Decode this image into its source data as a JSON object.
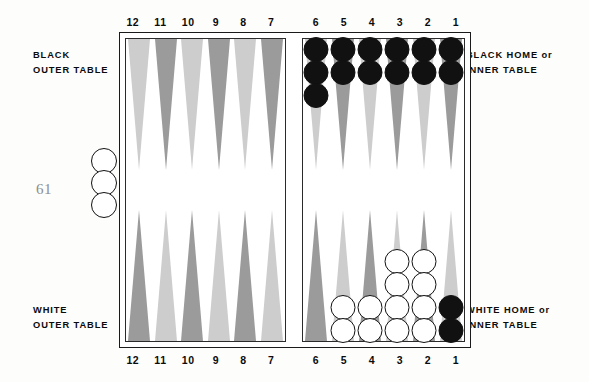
{
  "page": {
    "folio": "61"
  },
  "captions": {
    "black_outer": {
      "line1": "BLACK",
      "line2": "OUTER TABLE"
    },
    "black_home": {
      "line1": "BLACK HOME or",
      "line2": "INNER TABLE"
    },
    "white_outer": {
      "line1": "WHITE",
      "line2": "OUTER TABLE"
    },
    "white_home": {
      "line1": "WHITE HOME or",
      "line2": "INNER TABLE"
    }
  },
  "point_numbers": {
    "outer": [
      "12",
      "11",
      "10",
      "9",
      "8",
      "7"
    ],
    "inner": [
      "6",
      "5",
      "4",
      "3",
      "2",
      "1"
    ]
  },
  "colors": {
    "point_light": "#cdcdcd",
    "point_dark": "#9b9b9b",
    "checker_black": "#111111",
    "checker_white": "#ffffff",
    "board_border": "#1a1a1a",
    "text": "#0b0b0b",
    "folio": "#8d8d8d"
  },
  "board": {
    "quadrants": {
      "black_outer_top": [
        {
          "point": "12",
          "shade": "light",
          "checkers": 0,
          "color": null
        },
        {
          "point": "11",
          "shade": "dark",
          "checkers": 0,
          "color": null
        },
        {
          "point": "10",
          "shade": "light",
          "checkers": 0,
          "color": null
        },
        {
          "point": "9",
          "shade": "dark",
          "checkers": 0,
          "color": null
        },
        {
          "point": "8",
          "shade": "light",
          "checkers": 0,
          "color": null
        },
        {
          "point": "7",
          "shade": "dark",
          "checkers": 0,
          "color": null
        }
      ],
      "black_home_top": [
        {
          "point": "6",
          "shade": "light",
          "checkers": 3,
          "color": "black"
        },
        {
          "point": "5",
          "shade": "dark",
          "checkers": 2,
          "color": "black"
        },
        {
          "point": "4",
          "shade": "light",
          "checkers": 2,
          "color": "black"
        },
        {
          "point": "3",
          "shade": "dark",
          "checkers": 2,
          "color": "black"
        },
        {
          "point": "2",
          "shade": "light",
          "checkers": 2,
          "color": "black"
        },
        {
          "point": "1",
          "shade": "dark",
          "checkers": 2,
          "color": "black"
        }
      ],
      "white_outer_bottom": [
        {
          "point": "12",
          "shade": "dark",
          "checkers": 0,
          "color": null
        },
        {
          "point": "11",
          "shade": "light",
          "checkers": 0,
          "color": null
        },
        {
          "point": "10",
          "shade": "dark",
          "checkers": 0,
          "color": null
        },
        {
          "point": "9",
          "shade": "light",
          "checkers": 0,
          "color": null
        },
        {
          "point": "8",
          "shade": "dark",
          "checkers": 0,
          "color": null
        },
        {
          "point": "7",
          "shade": "light",
          "checkers": 0,
          "color": null
        }
      ],
      "white_home_bottom": [
        {
          "point": "6",
          "shade": "dark",
          "checkers": 0,
          "color": null
        },
        {
          "point": "5",
          "shade": "light",
          "checkers": 2,
          "color": "white"
        },
        {
          "point": "4",
          "shade": "dark",
          "checkers": 2,
          "color": "white"
        },
        {
          "point": "3",
          "shade": "light",
          "checkers": 4,
          "color": "white"
        },
        {
          "point": "2",
          "shade": "dark",
          "checkers": 4,
          "color": "white"
        },
        {
          "point": "1",
          "shade": "light",
          "checkers": 2,
          "color": "black"
        }
      ]
    },
    "off_board_left": {
      "checkers": 3,
      "color": "white"
    }
  }
}
